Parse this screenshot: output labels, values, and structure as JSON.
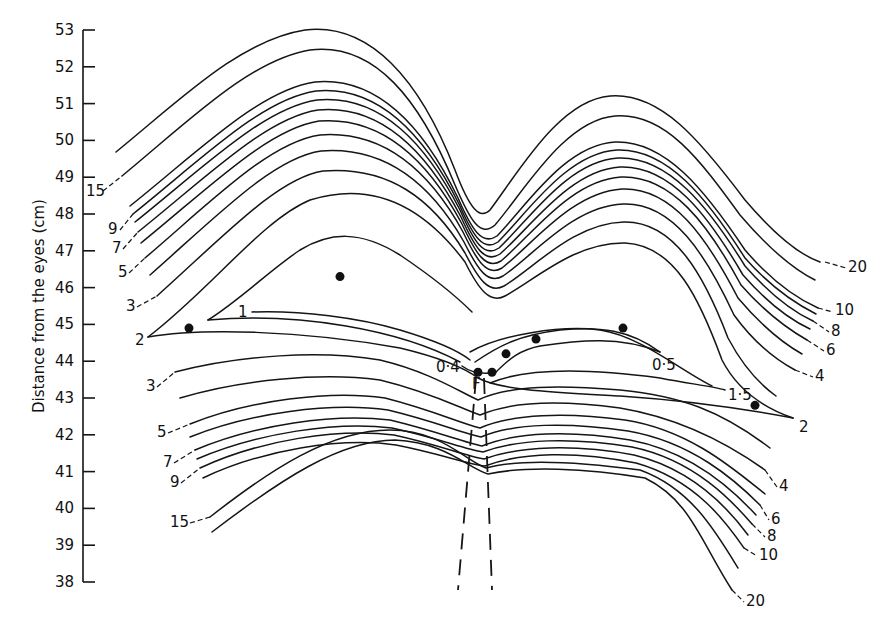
{
  "chart_data": {
    "type": "line",
    "subtype": "contour",
    "title": "",
    "xlabel": "",
    "ylabel": "Distance from the eyes (cm)",
    "ylim": [
      38,
      53
    ],
    "y_ticks": [
      "53",
      "52",
      "51",
      "50",
      "49",
      "48",
      "47",
      "46",
      "45",
      "44",
      "43",
      "42",
      "41",
      "40",
      "39",
      "38"
    ],
    "grid": false,
    "legend": "none",
    "fixation_point_label": "F",
    "contour_levels_left_upper": [
      "15",
      "9",
      "7",
      "5",
      "3",
      "2",
      "1"
    ],
    "contour_levels_left_lower": [
      "3",
      "5",
      "7",
      "9",
      "15"
    ],
    "contour_levels_right_upper": [
      "20",
      "10",
      "8",
      "6",
      "4",
      "2"
    ],
    "contour_levels_right_lower": [
      "4",
      "6",
      "8",
      "10",
      "20"
    ],
    "contour_levels_center": [
      "0·4",
      "0·5",
      "1·5"
    ],
    "series": [
      {
        "name": "0·4",
        "description": "innermost contour near fixation point F, ~43.7 cm"
      },
      {
        "name": "0·5",
        "description": "inner closed contour around F, spans ~44.0–45.0 cm"
      },
      {
        "name": "1",
        "description": "contour with peak near 46.3 cm on left"
      },
      {
        "name": "1·5",
        "description": "contour to the right, ~43.2 cm at label"
      },
      {
        "name": "2",
        "description": "contour ends at 44.7 cm (left) and 42.4 cm (right)"
      },
      {
        "name": "3",
        "description": "upper and lower branches"
      },
      {
        "name": "4",
        "description": "right side upper and lower branches"
      },
      {
        "name": "5",
        "description": "left side upper and lower branches"
      },
      {
        "name": "6",
        "description": "right side"
      },
      {
        "name": "7",
        "description": "left side"
      },
      {
        "name": "8",
        "description": "right side"
      },
      {
        "name": "9",
        "description": "left side"
      },
      {
        "name": "10",
        "description": "right side"
      },
      {
        "name": "15",
        "description": "left side, upper ~49.3 cm and lower ~40.0 cm"
      },
      {
        "name": "20",
        "description": "right side, upper peak ~53 cm, lower ~38.3 cm"
      }
    ],
    "data_points": [
      {
        "x_px": 189,
        "y_cm": 44.9
      },
      {
        "x_px": 340,
        "y_cm": 46.3
      },
      {
        "x_px": 478,
        "y_cm": 43.7
      },
      {
        "x_px": 492,
        "y_cm": 43.7
      },
      {
        "x_px": 506,
        "y_cm": 44.2
      },
      {
        "x_px": 536,
        "y_cm": 44.6
      },
      {
        "x_px": 623,
        "y_cm": 44.9
      },
      {
        "x_px": 755,
        "y_cm": 42.8
      }
    ]
  },
  "labels": {
    "left": [
      {
        "text": "15",
        "x": 86,
        "y": 196
      },
      {
        "text": "9",
        "x": 108,
        "y": 234
      },
      {
        "text": "7",
        "x": 112,
        "y": 253
      },
      {
        "text": "5",
        "x": 118,
        "y": 277
      },
      {
        "text": "3",
        "x": 126,
        "y": 311
      },
      {
        "text": "2",
        "x": 135,
        "y": 345
      },
      {
        "text": "1",
        "x": 238,
        "y": 317
      },
      {
        "text": "3",
        "x": 146,
        "y": 391
      },
      {
        "text": "5",
        "x": 157,
        "y": 437
      },
      {
        "text": "7",
        "x": 163,
        "y": 467
      },
      {
        "text": "9",
        "x": 170,
        "y": 487
      },
      {
        "text": "15",
        "x": 170,
        "y": 527
      }
    ],
    "center": [
      {
        "text": "0·4",
        "x": 436,
        "y": 372
      },
      {
        "text": "F",
        "x": 472,
        "y": 389
      },
      {
        "text": "0·5",
        "x": 652,
        "y": 370
      },
      {
        "text": "1·5",
        "x": 728,
        "y": 400
      }
    ],
    "right": [
      {
        "text": "20",
        "x": 848,
        "y": 272
      },
      {
        "text": "10",
        "x": 835,
        "y": 315
      },
      {
        "text": "8",
        "x": 831,
        "y": 336
      },
      {
        "text": "6",
        "x": 826,
        "y": 355
      },
      {
        "text": "4",
        "x": 815,
        "y": 381
      },
      {
        "text": "2",
        "x": 799,
        "y": 432
      },
      {
        "text": "4",
        "x": 779,
        "y": 491
      },
      {
        "text": "6",
        "x": 771,
        "y": 524
      },
      {
        "text": "8",
        "x": 767,
        "y": 541
      },
      {
        "text": "10",
        "x": 759,
        "y": 560
      },
      {
        "text": "20",
        "x": 746,
        "y": 606
      }
    ]
  }
}
